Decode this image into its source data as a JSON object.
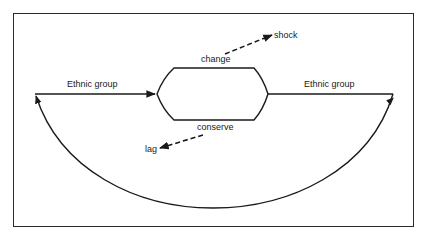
{
  "diagram": {
    "labels": {
      "left_group": "Ethnic group",
      "right_group": "Ethnic group",
      "change": "change",
      "conserve": "conserve",
      "shock": "shock",
      "lag": "lag"
    },
    "colors": {
      "stroke": "#1a1a1a",
      "frame": "#2a2a2a",
      "background": "#ffffff"
    }
  }
}
